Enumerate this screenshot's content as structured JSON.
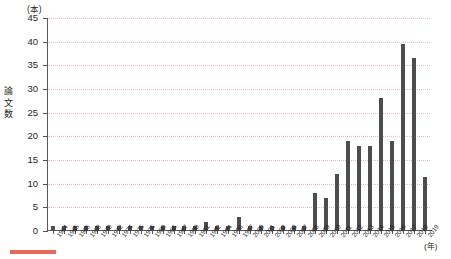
{
  "chart_data": {
    "type": "bar",
    "title": "",
    "subtitle": "",
    "unit_label": "(本)",
    "ylabel": "論文数",
    "xlabel": "(年)",
    "ylim": [
      0,
      45
    ],
    "ytick_step": 5,
    "yticks": [
      0,
      5,
      10,
      15,
      20,
      25,
      30,
      35,
      40,
      45
    ],
    "ytick_labels": [
      "0",
      "5",
      "10",
      "15",
      "20",
      "25",
      "30",
      "35",
      "40",
      "45"
    ],
    "grid": true,
    "legend": null,
    "bar_color": "#4d4d4d",
    "grid_color": "#e8b4b8",
    "axis_color": "#58595b",
    "accent_color": "#e8675c",
    "categories": [
      "1964",
      "1965",
      "1966",
      "1968",
      "1970",
      "1972",
      "1974",
      "1975",
      "1976",
      "1980",
      "1986",
      "1987",
      "1990",
      "1991",
      "1992",
      "1994",
      "1996",
      "1997",
      "2000",
      "2001",
      "2002",
      "2003",
      "2007",
      "2008",
      "2009",
      "2010",
      "2011",
      "2012",
      "2013",
      "2014",
      "2015",
      "2016",
      "2017",
      "2018",
      "2019"
    ],
    "values": [
      1,
      1,
      1,
      1,
      1,
      1,
      1,
      1,
      1,
      1,
      1,
      1,
      1,
      1,
      2,
      1,
      1,
      3,
      1,
      1,
      1,
      1,
      1,
      1,
      8,
      7,
      12,
      19,
      18,
      18,
      28,
      19,
      39.5,
      36.5,
      11.5
    ]
  },
  "footer": {
    "rule_color": "#e8675c"
  }
}
